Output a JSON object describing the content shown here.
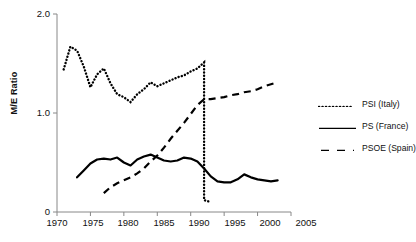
{
  "chart_data": {
    "type": "line",
    "title": "",
    "xlabel": "",
    "ylabel": "M/E Ratio",
    "xlim": [
      1970,
      2005
    ],
    "ylim": [
      0,
      2.0
    ],
    "xticks": [
      "1970",
      "1975",
      "1980",
      "1985",
      "1990",
      "1995",
      "2000",
      "2005"
    ],
    "yticks": [
      "0",
      "1.0",
      "2.0"
    ],
    "grid": false,
    "legend_position": "right",
    "series": [
      {
        "name": "PSI (Italy)",
        "style": "dotted",
        "color": "#000000",
        "x": [
          1971,
          1972,
          1973,
          1974,
          1975,
          1976,
          1977,
          1978,
          1979,
          1980,
          1981,
          1982,
          1983,
          1984,
          1985,
          1986,
          1987,
          1988,
          1989,
          1990,
          1991,
          1992,
          1992,
          1993
        ],
        "values": [
          1.44,
          1.67,
          1.63,
          1.47,
          1.26,
          1.39,
          1.45,
          1.3,
          1.19,
          1.16,
          1.11,
          1.19,
          1.24,
          1.31,
          1.27,
          1.3,
          1.33,
          1.36,
          1.38,
          1.42,
          1.45,
          1.51,
          0.12,
          0.1
        ]
      },
      {
        "name": "PS (France)",
        "style": "solid",
        "color": "#000000",
        "x": [
          1973,
          1974,
          1975,
          1976,
          1977,
          1978,
          1979,
          1980,
          1981,
          1982,
          1983,
          1984,
          1985,
          1986,
          1987,
          1988,
          1989,
          1990,
          1991,
          1992,
          1993,
          1994,
          1995,
          1996,
          1997,
          1998,
          1999,
          2000,
          2001,
          2002,
          2003
        ],
        "values": [
          0.35,
          0.42,
          0.49,
          0.53,
          0.54,
          0.53,
          0.55,
          0.5,
          0.47,
          0.53,
          0.56,
          0.58,
          0.55,
          0.52,
          0.51,
          0.52,
          0.55,
          0.54,
          0.51,
          0.44,
          0.36,
          0.31,
          0.3,
          0.3,
          0.33,
          0.38,
          0.35,
          0.33,
          0.32,
          0.31,
          0.32
        ]
      },
      {
        "name": "PSOE (Spain)",
        "style": "dashed",
        "color": "#000000",
        "x": [
          1977,
          1978,
          1979,
          1980,
          1981,
          1982,
          1983,
          1984,
          1985,
          1986,
          1987,
          1988,
          1989,
          1990,
          1991,
          1992,
          1993,
          1994,
          1995,
          1996,
          1997,
          1998,
          1999,
          2000,
          2001,
          2002,
          2003
        ],
        "values": [
          0.19,
          0.25,
          0.29,
          0.32,
          0.35,
          0.39,
          0.44,
          0.51,
          0.57,
          0.65,
          0.74,
          0.82,
          0.9,
          0.99,
          1.08,
          1.14,
          1.14,
          1.15,
          1.16,
          1.18,
          1.19,
          1.21,
          1.22,
          1.24,
          1.27,
          1.29,
          1.31
        ]
      }
    ]
  },
  "legend": {
    "items": [
      {
        "label": "PSI (Italy)"
      },
      {
        "label": "PS (France)"
      },
      {
        "label": "PSOE (Spain)"
      }
    ]
  }
}
